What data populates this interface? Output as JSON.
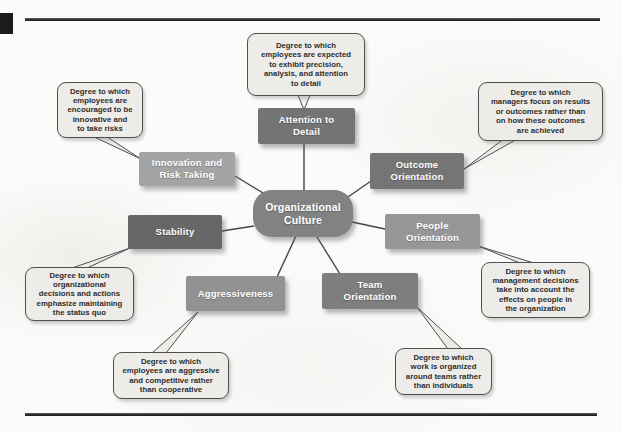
{
  "colors": {
    "rule": "#1b1b1b",
    "corner_block": "#1b1b1b",
    "connector": "#454545",
    "callout_fill": "#edece9",
    "callout_border": "#4f4f4f",
    "callout_text": "#2e2e2e",
    "node_label_text": "#ffffff"
  },
  "diagram": {
    "center": {
      "label": "Organizational\nCulture",
      "fill": "#828282"
    },
    "nodes": [
      {
        "id": "innovation-and-risk-taking",
        "label": "Innovation and\nRisk Taking",
        "fill": "#a4a4a4",
        "description": "Degree to which\nemployees are\nencouraged to be\ninnovative and\nto take risks"
      },
      {
        "id": "attention-to-detail",
        "label": "Attention to\nDetail",
        "fill": "#747474",
        "description": "Degree to which\nemployees are expected\nto exhibit precision,\nanalysis, and attention\nto detail"
      },
      {
        "id": "outcome-orientation",
        "label": "Outcome\nOrientation",
        "fill": "#757575",
        "description": "Degree to which\nmanagers focus on results\nor outcomes rather than\non how these outcomes\nare achieved"
      },
      {
        "id": "people-orientation",
        "label": "People\nOrientation",
        "fill": "#979797",
        "description": "Degree to which\nmanagement decisions\ntake into account the\neffects on people in\nthe organization"
      },
      {
        "id": "team-orientation",
        "label": "Team\nOrientation",
        "fill": "#7e7e7e",
        "description": "Degree to which\nwork is organized\naround teams rather\nthan individuals"
      },
      {
        "id": "aggressiveness",
        "label": "Aggressiveness",
        "fill": "#929292",
        "description": "Degree to which\nemployees are aggressive\nand competitive rather\nthan cooperative"
      },
      {
        "id": "stability",
        "label": "Stability",
        "fill": "#676767",
        "description": "Degree to which\norganizational\ndecisions and actions\nemphasize maintaining\nthe status quo"
      }
    ]
  }
}
